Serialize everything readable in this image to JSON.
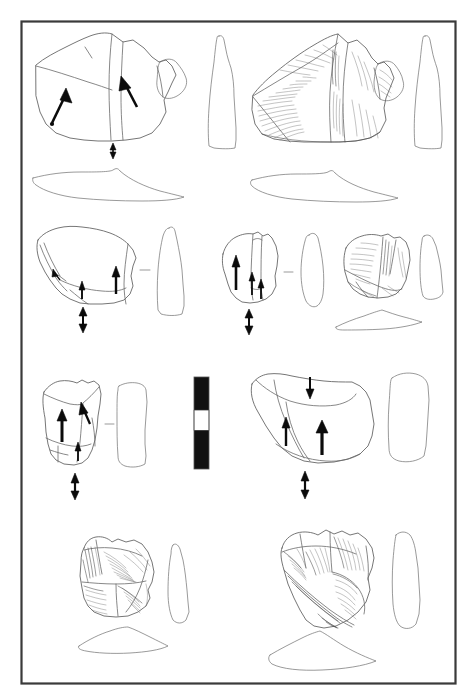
{
  "figure": {
    "kind": "archaeological-lithic-illustration-plate",
    "caption": "",
    "background_color": "#ffffff",
    "frame": {
      "stroke_color": "#3a3a3a",
      "x": 21,
      "y": 21,
      "width": 434,
      "height": 662
    },
    "ink_colors": {
      "outline": "#5d5d5d",
      "ridge": "#6a6a6a",
      "hatch": "#707070",
      "arrow": "#0b0b0b",
      "scale_bar_black": "#111111",
      "scale_bar_white": "#ffffff"
    }
  },
  "scale_bar": {
    "name": "scale-bar",
    "orientation": "vertical",
    "x": 194,
    "y": 377,
    "width": 15,
    "height": 92,
    "segments": [
      {
        "fill": "black",
        "length_fraction": 0.36
      },
      {
        "fill": "white",
        "length_fraction": 0.22
      },
      {
        "fill": "black",
        "length_fraction": 0.42
      }
    ],
    "label": ""
  },
  "rows": [
    {
      "id": "row-1",
      "label": "Row 1 — large cores, dorsal view, side profile and cross-section",
      "specimens": [
        {
          "id": "specimen-1a",
          "label": "Specimen 1 — outline drawing",
          "view": "dorsal-outline",
          "arrows": 3,
          "has_cross_section": true,
          "has_side_profile": true,
          "rendering": "line-outline"
        },
        {
          "id": "specimen-1b",
          "label": "Specimen 1 — shaded rendering",
          "view": "dorsal-shaded",
          "arrows": 0,
          "has_cross_section": true,
          "has_side_profile": true,
          "rendering": "hachured-shaded"
        }
      ]
    },
    {
      "id": "row-2",
      "label": "Row 2 — three specimens with side profiles",
      "specimens": [
        {
          "id": "specimen-2a",
          "label": "Specimen 2 — outline drawing",
          "view": "dorsal-outline",
          "arrows": 4,
          "has_cross_section": false,
          "has_side_profile": true,
          "rendering": "line-outline"
        },
        {
          "id": "specimen-2b",
          "label": "Specimen 3 — outline drawing",
          "view": "dorsal-outline",
          "arrows": 4,
          "has_cross_section": false,
          "has_side_profile": true,
          "rendering": "line-outline"
        },
        {
          "id": "specimen-2c",
          "label": "Specimen 4 — shaded rendering",
          "view": "dorsal-shaded",
          "arrows": 0,
          "has_cross_section": true,
          "has_side_profile": true,
          "rendering": "hachured-shaded"
        }
      ]
    },
    {
      "id": "row-3",
      "label": "Row 3 — two specimens flanking the scale bar",
      "specimens": [
        {
          "id": "specimen-3a",
          "label": "Specimen 5 — outline drawing",
          "view": "dorsal-outline",
          "arrows": 4,
          "has_cross_section": false,
          "has_side_profile": true,
          "rendering": "line-outline"
        },
        {
          "id": "specimen-3b",
          "label": "Specimen 6 — outline drawing",
          "view": "dorsal-outline",
          "arrows": 4,
          "has_cross_section": false,
          "has_side_profile": true,
          "rendering": "line-outline"
        }
      ]
    },
    {
      "id": "row-4",
      "label": "Row 4 — two shaded specimens with profiles and cross-sections",
      "specimens": [
        {
          "id": "specimen-4a",
          "label": "Specimen 7 — shaded rendering",
          "view": "dorsal-shaded",
          "arrows": 0,
          "has_cross_section": true,
          "has_side_profile": true,
          "rendering": "hachured-shaded"
        },
        {
          "id": "specimen-4b",
          "label": "Specimen 8 — shaded rendering",
          "view": "dorsal-shaded",
          "arrows": 0,
          "has_cross_section": true,
          "has_side_profile": true,
          "rendering": "hachured-shaded"
        }
      ]
    }
  ]
}
